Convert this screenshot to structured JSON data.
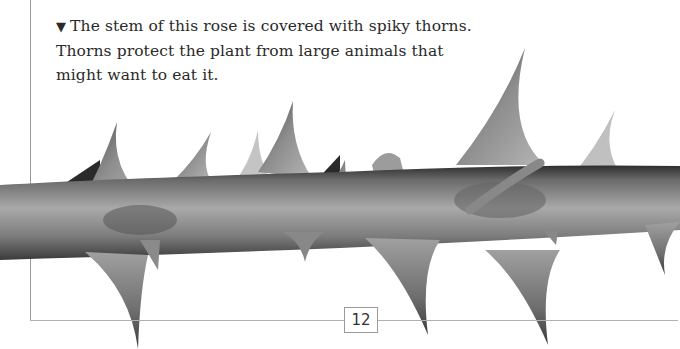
{
  "caption": {
    "marker": "▼",
    "text": "The stem of this rose is covered with spiky thorns. Thorns protect the plant from large animals that might want to eat it."
  },
  "photo": {
    "subject": "rose-stem-with-thorns",
    "colors": {
      "stem_light": "#b8b8b8",
      "stem_mid": "#8a8a8a",
      "stem_dark": "#3a3a3a",
      "thorn": "#7a7a7a"
    }
  },
  "page": {
    "number": "12"
  }
}
